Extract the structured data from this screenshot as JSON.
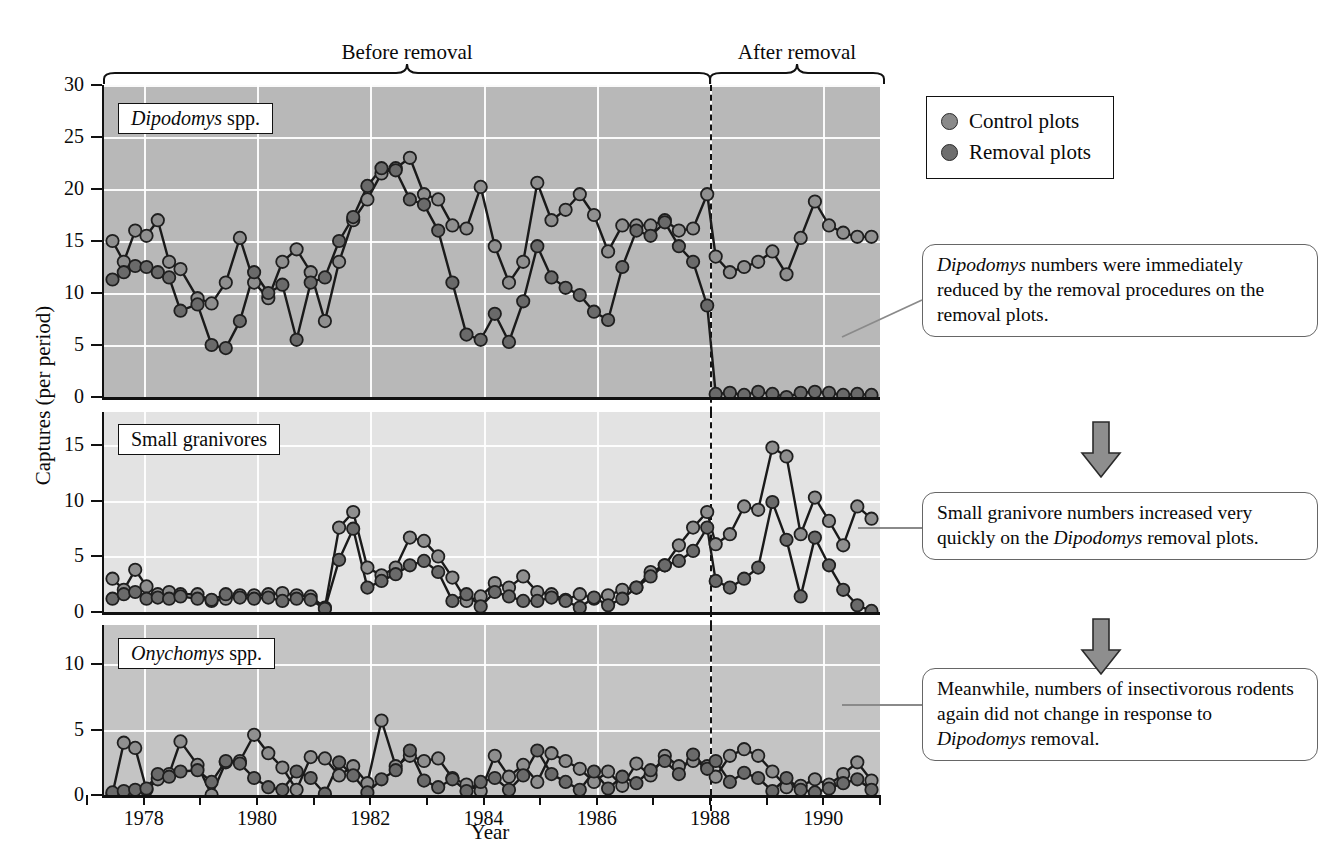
{
  "figure": {
    "y_axis_label": "Captures (per period)",
    "x_axis_label": "Year",
    "bracket_before": "Before removal",
    "bracket_after": "After removal",
    "removal_year": 1988
  },
  "legend": {
    "items": [
      {
        "label": "Control plots",
        "color": "#8a8a8a",
        "marker": "filled-circle"
      },
      {
        "label": "Removal plots",
        "color": "#6e6e6e",
        "marker": "filled-circle"
      }
    ]
  },
  "callouts": [
    {
      "name": "callout-dipodomys",
      "text_parts": [
        {
          "text": "Dipodomys",
          "italic": true
        },
        {
          "text": " numbers were immediately reduced by the removal procedures on the removal plots.",
          "italic": false
        }
      ]
    },
    {
      "name": "callout-granivores",
      "text_parts": [
        {
          "text": "Small granivore numbers increased very quickly on the ",
          "italic": false
        },
        {
          "text": "Dipodomys",
          "italic": true
        },
        {
          "text": " removal plots.",
          "italic": false
        }
      ]
    },
    {
      "name": "callout-onychomys",
      "text_parts": [
        {
          "text": "Meanwhile, numbers of insectivorous rodents again did not change in response to ",
          "italic": false
        },
        {
          "text": "Dipodomys",
          "italic": true
        },
        {
          "text": " removal.",
          "italic": false
        }
      ]
    }
  ],
  "chart_data": [
    {
      "type": "line",
      "name": "panel-dipodomys",
      "panel_label": "Dipodomys spp.",
      "panel_label_italic_word": "Dipodomys",
      "ylabel": "Captures (per period)",
      "xlabel": "Year",
      "ylim": [
        0,
        30
      ],
      "yticks": [
        0,
        5,
        10,
        15,
        20,
        25,
        30
      ],
      "xlim": [
        1977.3,
        1991.0
      ],
      "xticks": [
        1977,
        1978,
        1979,
        1980,
        1981,
        1982,
        1983,
        1984,
        1985,
        1986,
        1987,
        1988,
        1989,
        1990,
        1991
      ],
      "xticklabels": [
        "",
        "1978",
        "",
        "1980",
        "",
        "1982",
        "",
        "1984",
        "",
        "1986",
        "",
        "1988",
        "",
        "1990",
        ""
      ],
      "grid": true,
      "background": "#b8b8b8",
      "series": [
        {
          "name": "Control plots",
          "color": "#8f8f8f",
          "x": [
            1977.45,
            1977.65,
            1977.85,
            1978.05,
            1978.25,
            1978.45,
            1978.65,
            1978.95,
            1979.2,
            1979.45,
            1979.7,
            1979.95,
            1980.2,
            1980.45,
            1980.7,
            1980.95,
            1981.2,
            1981.45,
            1981.7,
            1981.95,
            1982.2,
            1982.45,
            1982.7,
            1982.95,
            1983.2,
            1983.45,
            1983.7,
            1983.95,
            1984.2,
            1984.45,
            1984.7,
            1984.95,
            1985.2,
            1985.45,
            1985.7,
            1985.95,
            1986.2,
            1986.45,
            1986.7,
            1986.95,
            1987.2,
            1987.45,
            1987.7,
            1987.95,
            1988.1,
            1988.35,
            1988.6,
            1988.85,
            1989.1,
            1989.35,
            1989.6,
            1989.85,
            1990.1,
            1990.35,
            1990.6,
            1990.85
          ],
          "y": [
            15.0,
            13.0,
            16.0,
            15.5,
            17.0,
            13.0,
            12.3,
            9.5,
            9.0,
            11.0,
            15.3,
            11.0,
            9.5,
            13.0,
            14.2,
            12.0,
            7.3,
            13.0,
            17.0,
            19.0,
            21.5,
            22.0,
            23.0,
            19.5,
            19.0,
            16.5,
            16.2,
            20.2,
            14.5,
            11.0,
            13.0,
            20.6,
            17.0,
            18.0,
            19.5,
            17.5,
            14.0,
            16.5,
            16.5,
            16.5,
            17.0,
            16.0,
            16.2,
            19.5,
            13.5,
            12.0,
            12.5,
            13.0,
            14.0,
            11.8,
            15.3,
            18.8,
            16.5,
            15.8,
            15.4,
            15.4
          ]
        },
        {
          "name": "Removal plots",
          "color": "#6a6a6a",
          "x": [
            1977.45,
            1977.65,
            1977.85,
            1978.05,
            1978.25,
            1978.45,
            1978.65,
            1978.95,
            1979.2,
            1979.45,
            1979.7,
            1979.95,
            1980.2,
            1980.45,
            1980.7,
            1980.95,
            1981.2,
            1981.45,
            1981.7,
            1981.95,
            1982.2,
            1982.45,
            1982.7,
            1982.95,
            1983.2,
            1983.45,
            1983.7,
            1983.95,
            1984.2,
            1984.45,
            1984.7,
            1984.95,
            1985.2,
            1985.45,
            1985.7,
            1985.95,
            1986.2,
            1986.45,
            1986.7,
            1986.95,
            1987.2,
            1987.45,
            1987.7,
            1987.95,
            1988.1,
            1988.35,
            1988.6,
            1988.85,
            1989.1,
            1989.35,
            1989.6,
            1989.85,
            1990.1,
            1990.35,
            1990.6,
            1990.85
          ],
          "y": [
            11.3,
            12.0,
            12.6,
            12.5,
            12.0,
            11.5,
            8.3,
            8.9,
            5.0,
            4.7,
            7.3,
            12.0,
            10.0,
            10.8,
            5.5,
            11.0,
            11.5,
            15.0,
            17.3,
            20.3,
            22.0,
            21.8,
            19.0,
            18.5,
            16.0,
            11.0,
            6.0,
            5.5,
            8.0,
            5.3,
            9.2,
            14.5,
            11.5,
            10.5,
            9.8,
            8.2,
            7.4,
            12.5,
            16.0,
            15.5,
            16.8,
            14.5,
            13.0,
            8.8,
            0.3,
            0.4,
            0.2,
            0.5,
            0.3,
            0.0,
            0.4,
            0.5,
            0.4,
            0.2,
            0.3,
            0.2
          ]
        }
      ]
    },
    {
      "type": "line",
      "name": "panel-small-granivores",
      "panel_label": "Small granivores",
      "ylim": [
        0,
        18
      ],
      "yticks": [
        0,
        5,
        10,
        15
      ],
      "xlim": [
        1977.3,
        1991.0
      ],
      "grid": true,
      "background": "#e3e3e3",
      "series": [
        {
          "name": "Control plots",
          "color": "#8f8f8f",
          "x": [
            1977.45,
            1977.65,
            1977.85,
            1978.05,
            1978.25,
            1978.45,
            1978.65,
            1978.95,
            1979.2,
            1979.45,
            1979.7,
            1979.95,
            1980.2,
            1980.45,
            1980.7,
            1980.95,
            1981.2,
            1981.45,
            1981.7,
            1981.95,
            1982.2,
            1982.45,
            1982.7,
            1982.95,
            1983.2,
            1983.45,
            1983.7,
            1983.95,
            1984.2,
            1984.45,
            1984.7,
            1984.95,
            1985.2,
            1985.45,
            1985.7,
            1985.95,
            1986.2,
            1986.45,
            1986.7,
            1986.95,
            1987.2,
            1987.45,
            1987.7,
            1987.95,
            1988.1,
            1988.35,
            1988.6,
            1988.85,
            1989.1,
            1989.35,
            1989.6,
            1989.85,
            1990.1,
            1990.35,
            1990.6,
            1990.85
          ],
          "y": [
            3.0,
            2.0,
            3.8,
            2.3,
            1.6,
            1.8,
            1.6,
            1.6,
            1.0,
            1.2,
            1.5,
            1.5,
            1.6,
            1.7,
            1.5,
            1.4,
            0.4,
            7.6,
            9.0,
            4.0,
            3.3,
            4.0,
            6.7,
            6.4,
            5.0,
            3.1,
            1.0,
            1.4,
            2.6,
            2.2,
            3.2,
            1.8,
            1.6,
            1.1,
            1.6,
            1.2,
            1.5,
            2.0,
            2.2,
            3.6,
            4.2,
            6.0,
            7.6,
            9.0,
            6.1,
            7.0,
            9.5,
            9.2,
            14.8,
            14.0,
            7.0,
            10.3,
            8.2,
            6.0,
            9.5,
            8.4
          ]
        },
        {
          "name": "Removal plots",
          "color": "#6a6a6a",
          "x": [
            1977.45,
            1977.65,
            1977.85,
            1978.05,
            1978.25,
            1978.45,
            1978.65,
            1978.95,
            1979.2,
            1979.45,
            1979.7,
            1979.95,
            1980.2,
            1980.45,
            1980.7,
            1980.95,
            1981.2,
            1981.45,
            1981.7,
            1981.95,
            1982.2,
            1982.45,
            1982.7,
            1982.95,
            1983.2,
            1983.45,
            1983.7,
            1983.95,
            1984.2,
            1984.45,
            1984.7,
            1984.95,
            1985.2,
            1985.45,
            1985.7,
            1985.95,
            1986.2,
            1986.45,
            1986.7,
            1986.95,
            1987.2,
            1987.45,
            1987.7,
            1987.95,
            1988.1,
            1988.35,
            1988.6,
            1988.85,
            1989.1,
            1989.35,
            1989.6,
            1989.85,
            1990.1,
            1990.35,
            1990.6,
            1990.85
          ],
          "y": [
            1.2,
            1.6,
            1.8,
            1.2,
            1.3,
            1.2,
            1.4,
            1.2,
            1.1,
            1.6,
            1.3,
            1.2,
            1.3,
            1.0,
            1.2,
            1.1,
            0.3,
            4.7,
            7.5,
            2.2,
            2.8,
            3.4,
            4.2,
            4.6,
            3.6,
            1.0,
            1.6,
            0.5,
            1.8,
            1.4,
            1.0,
            1.0,
            1.3,
            1.0,
            0.4,
            1.3,
            0.6,
            1.2,
            2.2,
            3.2,
            4.2,
            4.6,
            5.5,
            7.6,
            2.8,
            2.2,
            3.0,
            4.0,
            9.9,
            6.5,
            1.4,
            6.7,
            4.2,
            2.0,
            0.6,
            0.1
          ]
        }
      ]
    },
    {
      "type": "line",
      "name": "panel-onychomys",
      "panel_label": "Onychomys spp.",
      "panel_label_italic_word": "Onychomys",
      "ylim": [
        0,
        13
      ],
      "yticks": [
        0,
        5,
        10
      ],
      "xlim": [
        1977.3,
        1991.0
      ],
      "grid": true,
      "background": "#c4c4c4",
      "series": [
        {
          "name": "Control plots",
          "color": "#8f8f8f",
          "x": [
            1977.45,
            1977.65,
            1977.85,
            1978.05,
            1978.25,
            1978.45,
            1978.65,
            1978.95,
            1979.2,
            1979.45,
            1979.7,
            1979.95,
            1980.2,
            1980.45,
            1980.7,
            1980.95,
            1981.2,
            1981.45,
            1981.7,
            1981.95,
            1982.2,
            1982.45,
            1982.7,
            1982.95,
            1983.2,
            1983.45,
            1983.7,
            1983.95,
            1984.2,
            1984.45,
            1984.7,
            1984.95,
            1985.2,
            1985.45,
            1985.7,
            1985.95,
            1986.2,
            1986.45,
            1986.7,
            1986.95,
            1987.2,
            1987.45,
            1987.7,
            1987.95,
            1988.1,
            1988.35,
            1988.6,
            1988.85,
            1989.1,
            1989.35,
            1989.6,
            1989.85,
            1990.1,
            1990.35,
            1990.6,
            1990.85
          ],
          "y": [
            0.1,
            4.0,
            3.6,
            0.4,
            1.2,
            1.6,
            4.1,
            2.3,
            0.0,
            2.5,
            2.6,
            4.6,
            3.2,
            2.1,
            0.4,
            2.9,
            2.8,
            1.5,
            2.2,
            0.9,
            5.7,
            2.2,
            3.0,
            2.6,
            2.8,
            1.3,
            0.8,
            0.3,
            3.0,
            1.4,
            2.3,
            1.0,
            3.2,
            2.6,
            2.0,
            1.0,
            1.8,
            0.7,
            2.4,
            1.5,
            3.0,
            2.2,
            2.6,
            2.2,
            1.4,
            3.0,
            3.5,
            3.0,
            1.8,
            0.6,
            0.7,
            1.2,
            0.8,
            1.6,
            2.5,
            1.1
          ]
        },
        {
          "name": "Removal plots",
          "color": "#6a6a6a",
          "x": [
            1977.45,
            1977.65,
            1977.85,
            1978.05,
            1978.25,
            1978.45,
            1978.65,
            1978.95,
            1979.2,
            1979.45,
            1979.7,
            1979.95,
            1980.2,
            1980.45,
            1980.7,
            1980.95,
            1981.2,
            1981.45,
            1981.7,
            1981.95,
            1982.2,
            1982.45,
            1982.7,
            1982.95,
            1983.2,
            1983.45,
            1983.7,
            1983.95,
            1984.2,
            1984.45,
            1984.7,
            1984.95,
            1985.2,
            1985.45,
            1985.7,
            1985.95,
            1986.2,
            1986.45,
            1986.7,
            1986.95,
            1987.2,
            1987.45,
            1987.7,
            1987.95,
            1988.1,
            1988.35,
            1988.6,
            1988.85,
            1989.1,
            1989.35,
            1989.6,
            1989.85,
            1990.1,
            1990.35,
            1990.6,
            1990.85
          ],
          "y": [
            0.2,
            0.3,
            0.4,
            0.5,
            1.6,
            1.4,
            1.8,
            1.9,
            1.0,
            2.6,
            2.4,
            1.3,
            0.6,
            0.4,
            1.8,
            1.3,
            0.1,
            2.5,
            1.5,
            0.2,
            1.2,
            1.9,
            3.4,
            1.1,
            0.6,
            1.2,
            0.3,
            1.0,
            1.3,
            0.4,
            1.5,
            3.4,
            1.6,
            1.0,
            0.4,
            1.8,
            0.5,
            1.4,
            0.9,
            1.9,
            2.6,
            1.6,
            3.1,
            2.0,
            2.6,
            1.0,
            1.7,
            1.3,
            0.3,
            1.3,
            0.4,
            0.2,
            0.5,
            0.9,
            1.2,
            0.4
          ]
        }
      ]
    }
  ]
}
